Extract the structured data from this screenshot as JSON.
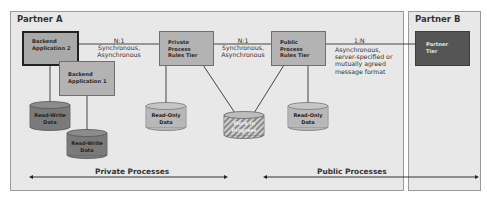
{
  "partners": {
    "a": {
      "title": "Partner A"
    },
    "b": {
      "title": "Partner B"
    }
  },
  "components": {
    "backend_app_2": {
      "line1": "Backend",
      "line2": "Application 2"
    },
    "backend_app_1": {
      "line1": "Backend",
      "line2": "Application 1"
    },
    "private_rules": {
      "line1": "Private",
      "line2": "Process",
      "line3": "Rules Tier"
    },
    "public_rules": {
      "line1": "Public",
      "line2": "Process",
      "line3": "Rules Tier"
    },
    "partner_tier": {
      "line1": "Partner",
      "line2": "Tier"
    }
  },
  "connections": {
    "backend_to_private": {
      "cardinality": "N:1",
      "line1": "Synchronous,",
      "line2": "Asynchronous"
    },
    "private_to_public": {
      "cardinality": "N:1",
      "line1": "Synchronous,",
      "line2": "Asynchronous"
    },
    "public_to_partner": {
      "cardinality": "1:N",
      "line1": "Asynchronous,",
      "line2": "server-specified or",
      "line3": "mutually agreed",
      "line4": "message format"
    }
  },
  "datastores": {
    "rw1": {
      "line1": "Read-Write",
      "line2": "Data"
    },
    "rw2": {
      "line1": "Read-Write",
      "line2": "Data"
    },
    "ro_private": {
      "line1": "Read-Only",
      "line2": "Data"
    },
    "wip": {
      "line1": "Work in",
      "line2": "Progress"
    },
    "ro_public": {
      "line1": "Read-Only",
      "line2": "Data"
    }
  },
  "processes": {
    "private": "Private Processes",
    "public": "Public Processes"
  },
  "colors": {
    "partner_bg": "#e8e8e8",
    "box_gray": "#b3b3b3",
    "rw_data": "#7a7a7a",
    "ro_data": "#b8b8b8",
    "partner_tier": "#555555"
  }
}
